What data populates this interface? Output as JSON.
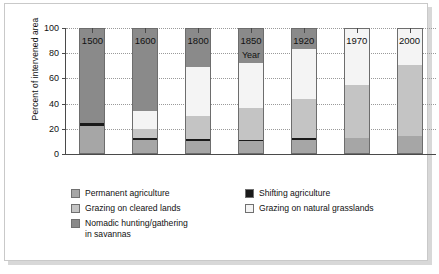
{
  "chart_data": {
    "type": "bar",
    "subtype": "stacked-bar-100-percent",
    "title": "",
    "xlabel": "Year",
    "ylabel": "Percent of intervened area",
    "categories": [
      "1500",
      "1600",
      "1800",
      "1850",
      "1920",
      "1970",
      "2000"
    ],
    "ylim": [
      0,
      100
    ],
    "yticks": [
      0,
      20,
      40,
      60,
      80,
      100
    ],
    "ytick_labels": [
      "0",
      "20",
      "40",
      "60",
      "80",
      "100"
    ],
    "grid": true,
    "grid_axis": "y",
    "legend_position": "below",
    "stack_order_bottom_to_top": [
      "Permanent agriculture",
      "Shifting agriculture",
      "Grazing on cleared lands",
      "Grazing on natural grasslands",
      "Nomadic hunting/gathering in savannas"
    ],
    "series": [
      {
        "name": "Permanent agriculture",
        "color": "#a6a6a6",
        "values": [
          22,
          11,
          10,
          10,
          11,
          13,
          14
        ]
      },
      {
        "name": "Shifting agriculture",
        "color": "#1a1a1a",
        "values": [
          3,
          2,
          2,
          1.5,
          2,
          0,
          0
        ]
      },
      {
        "name": "Grazing on cleared lands",
        "color": "#c4c4c4",
        "values": [
          0,
          7,
          18,
          25,
          31,
          42,
          57
        ]
      },
      {
        "name": "Grazing on natural grasslands",
        "color": "#f4f4f4",
        "values": [
          0,
          14,
          39,
          36,
          39,
          45,
          29
        ]
      },
      {
        "name": "Nomadic hunting/gathering in savannas",
        "color": "#8a8a8a",
        "values": [
          75,
          66,
          31,
          27.5,
          17,
          0,
          0
        ]
      }
    ]
  },
  "legend": {
    "items": [
      {
        "label": "Permanent agriculture",
        "color": "#a6a6a6",
        "column": "left",
        "row": 0
      },
      {
        "label": "Shifting agriculture",
        "color": "#1a1a1a",
        "column": "right",
        "row": 0
      },
      {
        "label": "Grazing on cleared lands",
        "color": "#c4c4c4",
        "column": "left",
        "row": 1
      },
      {
        "label": "Grazing on natural grasslands",
        "color": "#f4f4f4",
        "column": "right",
        "row": 1
      },
      {
        "label": "Nomadic hunting/gathering\nin savannas",
        "color": "#8a8a8a",
        "column": "left",
        "row": 2
      }
    ]
  }
}
